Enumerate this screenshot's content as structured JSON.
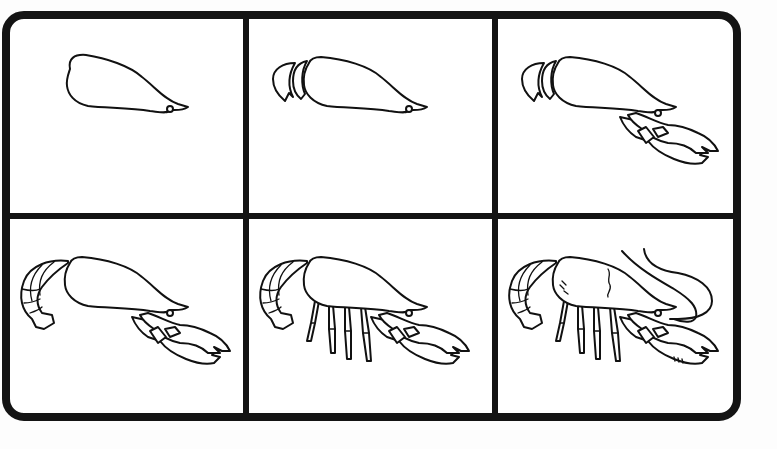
{
  "worksheet": {
    "title": "How to draw a lobster — step-by-step",
    "layout": {
      "columns": 3,
      "rows": 2
    },
    "colors": {
      "background": "#ffffff",
      "frame": "#141414",
      "line": "#111111"
    },
    "panels": [
      {
        "step": 1,
        "description": "Draw the elongated body (carapace) with a pointed head and a small eye loop",
        "parts": [
          "body",
          "eye"
        ]
      },
      {
        "step": 2,
        "description": "Add the first two tail segments at the back of the body",
        "parts": [
          "body",
          "eye",
          "tail-start"
        ]
      },
      {
        "step": 3,
        "description": "Add the two large claws extending forward from under the head",
        "parts": [
          "body",
          "eye",
          "tail-start",
          "claws"
        ]
      },
      {
        "step": 4,
        "description": "Complete the curled, segmented tail with a fan at the end",
        "parts": [
          "body",
          "eye",
          "tail-full",
          "claws"
        ]
      },
      {
        "step": 5,
        "description": "Draw the four segmented walking legs beneath the body",
        "parts": [
          "body",
          "eye",
          "tail-full",
          "claws",
          "legs"
        ]
      },
      {
        "step": 6,
        "description": "Finish with long antennae, a carapace seam and small texture marks",
        "parts": [
          "body",
          "eye",
          "tail-full",
          "claws",
          "legs",
          "antennae",
          "details"
        ]
      }
    ]
  }
}
